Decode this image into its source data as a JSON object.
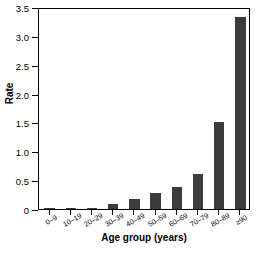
{
  "chart_data": {
    "type": "bar",
    "title": "",
    "xlabel": "Age group (years)",
    "ylabel": "Rate",
    "categories": [
      "0–9",
      "10–19",
      "20–29",
      "30–39",
      "40–49",
      "50–59",
      "60–69",
      "70–79",
      "80–89",
      "≥90"
    ],
    "values": [
      0.005,
      0.01,
      0.02,
      0.09,
      0.17,
      0.28,
      0.38,
      0.6,
      1.51,
      3.33
    ],
    "yticks": [
      "0",
      "0.5",
      "1.0",
      "1.5",
      "2.0",
      "2.5",
      "3.0",
      "3.5"
    ],
    "ytick_values": [
      0,
      0.5,
      1.0,
      1.5,
      2.0,
      2.5,
      3.0,
      3.5
    ],
    "ylim": [
      0,
      3.5
    ],
    "grid": false,
    "legend": false,
    "bar_color": "#3b3b3b",
    "axis_color": "#000000",
    "background": "#ffffff"
  }
}
